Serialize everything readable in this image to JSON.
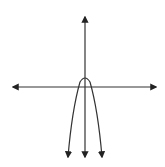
{
  "diagram": {
    "type": "coordinate-graph",
    "colors": {
      "background": "#ffffff",
      "stroke": "#222222"
    },
    "axes": {
      "x_axis": {
        "arrows": [
          "left",
          "right"
        ],
        "labels": []
      },
      "y_axis": {
        "arrows": [
          "up",
          "down"
        ],
        "labels": []
      }
    },
    "curve": {
      "kind": "parabola",
      "opens": "down",
      "vertex_position": "slightly above origin",
      "ends": "arrows pointing down on both branches"
    }
  }
}
